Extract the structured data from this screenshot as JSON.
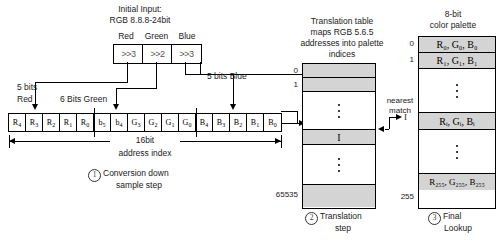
{
  "diagram": {
    "title_line1": "Initial Input:",
    "title_line2": "RGB 8.8.8-24bit",
    "channel_labels": {
      "red": "Red",
      "green": "Green",
      "blue": "Blue"
    },
    "shift_ops": {
      "red": ">>3",
      "green": ">>2",
      "blue": ">>3"
    },
    "bit_labels": {
      "red": "5 bits\nRed",
      "red_l1": "5 bits",
      "red_l2": "Red",
      "green": "6 Bits Green",
      "blue": "5 bits Blue"
    },
    "bit_cells": [
      {
        "letter": "R",
        "sub": "4"
      },
      {
        "letter": "R",
        "sub": "3"
      },
      {
        "letter": "R",
        "sub": "2"
      },
      {
        "letter": "R",
        "sub": "1"
      },
      {
        "letter": "R",
        "sub": "0"
      },
      {
        "letter": "b",
        "sub": "5"
      },
      {
        "letter": "b",
        "sub": "4"
      },
      {
        "letter": "G",
        "sub": "3"
      },
      {
        "letter": "G",
        "sub": "2"
      },
      {
        "letter": "G",
        "sub": "1"
      },
      {
        "letter": "G",
        "sub": "0"
      },
      {
        "letter": "B",
        "sub": "4"
      },
      {
        "letter": "B",
        "sub": "3"
      },
      {
        "letter": "B",
        "sub": "2"
      },
      {
        "letter": "B",
        "sub": "1"
      },
      {
        "letter": "B",
        "sub": "0"
      }
    ],
    "width_label_line1": "16bit",
    "width_label_line2": "address index",
    "steps": {
      "step1_num": "1",
      "step1_line1": "Conversion down",
      "step1_line2": "sample step",
      "step2_num": "2",
      "step2_line1": "Translation",
      "step2_line2": "step",
      "step3_num": "3",
      "step3_line1": "Final",
      "step3_line2": "Lookup"
    },
    "translation_table": {
      "caption_line1": "Translation table",
      "caption_line2": "maps RGB 5.6.5",
      "caption_line3": "addresses into palette",
      "caption_line4": "indices",
      "index_first": "0",
      "index_second": "1",
      "index_last": "65535",
      "match_value": "I"
    },
    "nearest_match": {
      "line1": "nearest",
      "line2": "match",
      "value": "I"
    },
    "palette": {
      "caption_line1": "8-bit",
      "caption_line2": "color palette",
      "index_first": "0",
      "index_second": "1",
      "index_last": "255",
      "entry_0": "R₀, G₀, B₀",
      "entry_1": "R₁, G₁, B₁",
      "entry_I": "Rᵢ, Gᵢ, Bᵢ",
      "entry_255": "R₂₅₅, G₂₅₅, B₂₅₅"
    }
  }
}
